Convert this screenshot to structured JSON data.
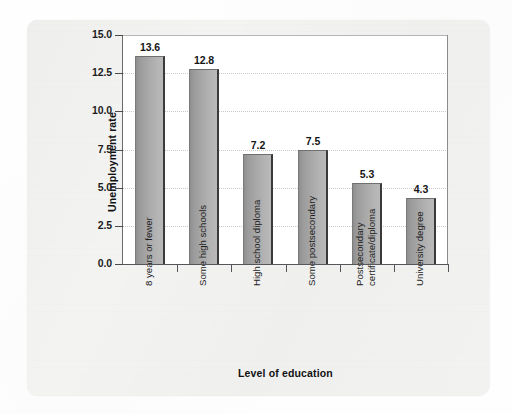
{
  "chart_data": {
    "type": "bar",
    "title": "",
    "xlabel": "Level of education",
    "ylabel": "Unemployment rate",
    "categories": [
      "8 years or fewer",
      "Some high schools",
      "High school diploma",
      "Some postsecondary",
      "Postsecondary certificate/diploma",
      "University degree"
    ],
    "category_lines": [
      [
        "8 years or fewer"
      ],
      [
        "Some high schools"
      ],
      [
        "High school diploma"
      ],
      [
        "Some postsecondary"
      ],
      [
        "Postsecondary",
        "certificate/diploma"
      ],
      [
        "University degree"
      ]
    ],
    "values": [
      13.6,
      12.8,
      7.2,
      7.5,
      5.3,
      4.3
    ],
    "value_labels": [
      "13.6",
      "12.8",
      "7.2",
      "7.5",
      "5.3",
      "4.3"
    ],
    "ylim": [
      0.0,
      15.0
    ],
    "ytick_values": [
      0.0,
      2.5,
      5.0,
      7.5,
      10.0,
      12.5,
      15.0
    ],
    "ytick_labels": [
      "0.0",
      "2.5",
      "5.0",
      "7.5",
      "10.0",
      "12.5",
      "15.0"
    ],
    "grid": "horizontal-dotted",
    "legend": "none",
    "bar_color_dark": "#8e8e8e",
    "bar_color_light": "#b9b9b9",
    "bar_edge_color": "#3a3a3a",
    "plot_background": "#ffffff",
    "panel_background": "#f4f4f3"
  }
}
